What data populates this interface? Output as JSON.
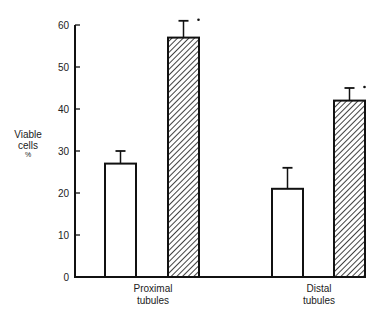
{
  "chart_data": {
    "type": "bar",
    "title": "",
    "xlabel": "",
    "ylabel": "Viable cells %",
    "ylabel_lines": [
      "Viable",
      "cells",
      "%"
    ],
    "ylim": [
      0,
      60
    ],
    "yticks": [
      0,
      10,
      20,
      30,
      40,
      50,
      60
    ],
    "grid": false,
    "legend": null,
    "categories": [
      "Proximal tubules",
      "Distal tubules"
    ],
    "category_lines": [
      [
        "Proximal",
        "tubules"
      ],
      [
        "Distal",
        "tubules"
      ]
    ],
    "series": [
      {
        "name": "Control (open bars)",
        "fill": "white",
        "values": [
          27,
          21
        ],
        "error_upper": [
          30,
          26
        ]
      },
      {
        "name": "Treated (hatched bars)",
        "fill": "hatched",
        "values": [
          57,
          42
        ],
        "error_upper": [
          61,
          45
        ],
        "significance_marker": [
          "*",
          "*"
        ]
      }
    ],
    "annotations": [
      "* significance marker above each hatched bar"
    ]
  },
  "colors": {
    "ink": "#111111",
    "background": "#ffffff"
  }
}
